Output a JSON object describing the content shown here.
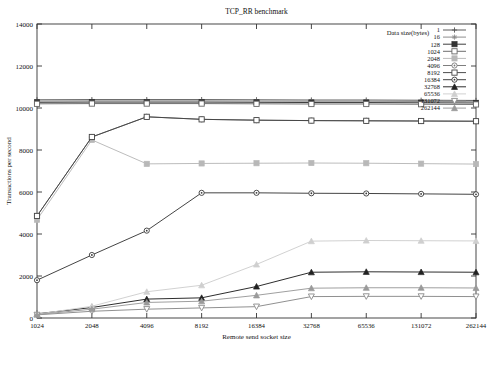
{
  "chart_data": {
    "type": "line",
    "title": "TCP_RR benchmark",
    "xlabel": "Remote send socket size",
    "ylabel": "Transactions per second",
    "legend_title": "Data size(bytes)",
    "legend_position": "top-right-inside",
    "grid": false,
    "x_scale": "categorical-log2",
    "categories": [
      "1024",
      "2048",
      "4096",
      "8192",
      "16384",
      "32768",
      "65536",
      "131072",
      "262144"
    ],
    "xticklabels": [
      "1024",
      "2048",
      "4096",
      "8192",
      "16384",
      "32768",
      "65536",
      "131072",
      "262144"
    ],
    "yticklabels": [
      "0",
      "2000",
      "4000",
      "6000",
      "8000",
      "10000",
      "12000",
      "14000"
    ],
    "ylim": [
      0,
      14000
    ],
    "ytick_step": 2000,
    "series": [
      {
        "name": "1",
        "marker": "plus",
        "color": "#555555",
        "values": [
          10390,
          10400,
          10400,
          10400,
          10390,
          10380,
          10380,
          10370,
          10360
        ]
      },
      {
        "name": "16",
        "marker": "asterisk",
        "color": "#888888",
        "values": [
          10330,
          10340,
          10340,
          10340,
          10330,
          10320,
          10320,
          10310,
          10300
        ]
      },
      {
        "name": "128",
        "marker": "filled-square",
        "color": "#333333",
        "values": [
          10270,
          10280,
          10280,
          10280,
          10270,
          10260,
          10260,
          10250,
          10240
        ]
      },
      {
        "name": "1024",
        "marker": "open-square",
        "color": "#666666",
        "values": [
          10200,
          10210,
          10210,
          10210,
          10200,
          10190,
          10190,
          10180,
          10170
        ]
      },
      {
        "name": "2048",
        "marker": "light-square",
        "color": "#b8b8b8",
        "values": [
          4680,
          8480,
          7340,
          7360,
          7370,
          7380,
          7370,
          7350,
          7330
        ]
      },
      {
        "name": "4096",
        "marker": "circle-dot",
        "color": "#777777",
        "values": [
          4860,
          8620,
          9580,
          9460,
          9420,
          9400,
          9390,
          9380,
          9370
        ]
      },
      {
        "name": "8192",
        "marker": "open-square-2",
        "color": "#444444",
        "values": [
          4860,
          8620,
          9580,
          9460,
          9420,
          9400,
          9390,
          9380,
          9370
        ]
      },
      {
        "name": "16384",
        "marker": "small-circle",
        "color": "#3a3a3a",
        "values": [
          1800,
          3000,
          4160,
          5960,
          5960,
          5940,
          5930,
          5910,
          5890
        ]
      },
      {
        "name": "32768",
        "marker": "filled-triangle",
        "color": "#222222",
        "values": [
          200,
          500,
          900,
          960,
          1500,
          2180,
          2200,
          2190,
          2180
        ]
      },
      {
        "name": "65536",
        "marker": "light-triangle",
        "color": "#cfcfcf",
        "values": [
          180,
          560,
          1250,
          1560,
          2550,
          3660,
          3690,
          3680,
          3670
        ]
      },
      {
        "name": "131072",
        "marker": "down-triangle",
        "color": "#8a8a8a",
        "values": [
          150,
          320,
          420,
          480,
          540,
          1020,
          1030,
          1030,
          1020
        ]
      },
      {
        "name": "262144",
        "marker": "filled-triangle-2",
        "color": "#9a9a9a",
        "values": [
          160,
          420,
          740,
          800,
          1080,
          1420,
          1440,
          1440,
          1430
        ]
      }
    ]
  }
}
